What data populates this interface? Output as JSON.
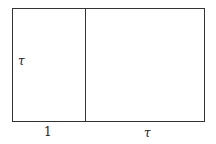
{
  "diagram": {
    "labels": {
      "left_height": "τ",
      "left_width": "1",
      "right_width": "τ"
    },
    "colors": {
      "stroke": "#333333",
      "background": "#ffffff"
    }
  }
}
